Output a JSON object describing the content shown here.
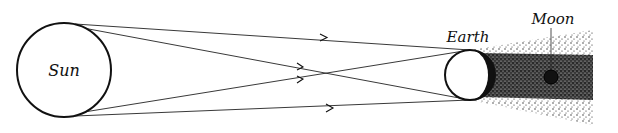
{
  "diagram": {
    "labels": {
      "sun": "Sun",
      "earth": "Earth",
      "moon": "Moon"
    },
    "colors": {
      "ink": "#111111",
      "background": "#ffffff",
      "shadow_dense": "#1a1a1a",
      "shadow_light": "#555555"
    },
    "elements": [
      {
        "name": "sun",
        "shape": "circle",
        "cx": 64,
        "cy": 70,
        "r": 47
      },
      {
        "name": "earth",
        "shape": "circle",
        "cx": 470,
        "cy": 75,
        "r": 25
      },
      {
        "name": "moon",
        "shape": "circle",
        "cx": 551,
        "cy": 77,
        "r": 7
      }
    ],
    "rays": [
      {
        "from": "sun-top",
        "to": "earth-top",
        "arrow": true
      },
      {
        "from": "sun-top",
        "to": "earth-bottom",
        "arrow": true
      },
      {
        "from": "sun-bottom",
        "to": "earth-top",
        "arrow": true
      },
      {
        "from": "sun-bottom",
        "to": "earth-bottom",
        "arrow": true
      }
    ],
    "regions": [
      {
        "name": "umbra",
        "description": "dense stippled cone behind Earth"
      },
      {
        "name": "penumbra",
        "description": "light stippled outer bands"
      }
    ]
  }
}
